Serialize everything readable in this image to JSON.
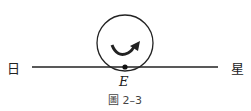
{
  "diagram": {
    "left_label": "日",
    "right_label": "星",
    "point_label": "E",
    "caption": "圖 2–3",
    "line": {
      "x1": 32,
      "y1": 67,
      "x2": 218,
      "y2": 67
    },
    "circle": {
      "cx": 125,
      "cy": 43,
      "r": 28
    },
    "point": {
      "cx": 125,
      "cy": 67,
      "r": 2.5
    },
    "rotation_arrow": "counterclockwise-curved-arrow",
    "colors": {
      "stroke": "#222222",
      "text": "#222222",
      "caption": "#444444"
    }
  }
}
